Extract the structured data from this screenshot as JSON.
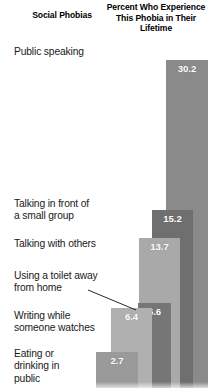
{
  "headers": {
    "left": "Social\nPhobias",
    "right": "Percent Who\nExperience This Phobia\nin Their Lifetime"
  },
  "chart_data": {
    "type": "bar",
    "title": "Percent Who Experience This Phobia in Their Lifetime",
    "subtitle": "Social Phobias",
    "xlabel": "Social Phobias",
    "ylabel": "Percent Who Experience This Phobia in Their Lifetime",
    "grid": false,
    "legend": false,
    "ylim": [
      0,
      30.2
    ],
    "categories": [
      "Public speaking",
      "Talking in front of\na small group",
      "Talking with others",
      "Using a toilet away\nfrom home",
      "Writing while\nsomeone watches",
      "Eating or\ndrinking in\npublic"
    ],
    "values": [
      30.2,
      15.2,
      13.7,
      6.6,
      6.4,
      2.7
    ],
    "value_labels": [
      "30.2",
      "15.2",
      "13.7",
      "6.6",
      "6.4",
      "2.7"
    ],
    "bar_colors": [
      "#8a8a8a",
      "#6f6f6f",
      "#a9a9a9",
      "#767676",
      "#b0b0b0",
      "#9a9a9a"
    ],
    "annotations": [
      {
        "text": "Using a toilet away\nfrom home",
        "points_to": "6.4"
      }
    ]
  },
  "bars": [
    {
      "label": "30.2",
      "left": 166,
      "width": 42,
      "top": 60,
      "color": "#8a8a8a"
    },
    {
      "label": "15.2",
      "left": 152,
      "width": 41,
      "top": 210,
      "color": "#6f6f6f"
    },
    {
      "label": "13.7",
      "left": 139,
      "width": 41,
      "top": 238,
      "color": "#a9a9a9"
    },
    {
      "label": "6.6",
      "left": 138,
      "width": 33,
      "top": 303,
      "color": "#767676"
    },
    {
      "label": "6.4",
      "left": 111,
      "width": 41,
      "top": 308,
      "color": "#b0b0b0"
    },
    {
      "label": "2.7",
      "left": 96,
      "width": 42,
      "top": 352,
      "color": "#9a9a9a"
    }
  ],
  "labels": [
    {
      "name": "public-speaking",
      "text": "Public speaking",
      "top": 46
    },
    {
      "name": "small-group",
      "text": "Talking in front of\na small group",
      "top": 198
    },
    {
      "name": "talking-others",
      "text": "Talking with others",
      "top": 238
    },
    {
      "name": "toilet-away",
      "text": "Using a toilet away\nfrom home",
      "top": 270
    },
    {
      "name": "writing-watched",
      "text": "Writing while\nsomeone watches",
      "top": 310
    },
    {
      "name": "eating-drinking",
      "text": "Eating or\ndrinking in\npublic",
      "top": 348
    }
  ]
}
